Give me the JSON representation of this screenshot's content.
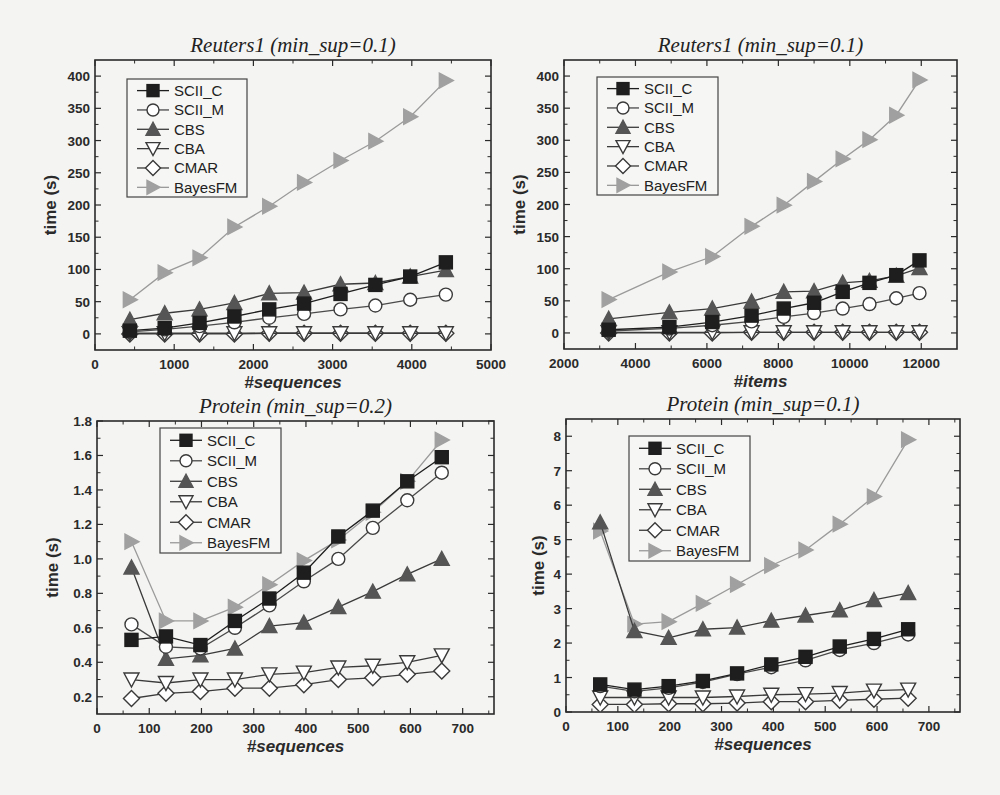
{
  "background_text": "",
  "chart_data": [
    {
      "type": "line",
      "title": "Reuters1 (min_sup=0.1)",
      "xlabel": "#sequences",
      "ylabel": "time (s)",
      "xlim": [
        0,
        5000
      ],
      "ylim": [
        -25,
        425
      ],
      "xticks": [
        0,
        1000,
        2000,
        3000,
        4000,
        5000
      ],
      "yticks": [
        0,
        50,
        100,
        150,
        200,
        250,
        300,
        350,
        400
      ],
      "ytick_labels": [
        "0",
        "50",
        "100",
        "150",
        "200",
        "250",
        "300",
        "350",
        "400"
      ],
      "frame": {
        "x0": 95,
        "y0": 60,
        "x1": 491,
        "y1": 350
      },
      "legend": {
        "x": 127,
        "y": 79,
        "w": 120,
        "h": 118
      },
      "x": [
        440,
        880,
        1320,
        1760,
        2200,
        2640,
        3100,
        3540,
        3980,
        4430
      ],
      "series": [
        {
          "name": "SCII_C",
          "values": [
            5,
            9,
            17,
            27,
            38,
            47,
            62,
            76,
            89,
            111
          ]
        },
        {
          "name": "SCII_M",
          "values": [
            3,
            7,
            12,
            18,
            25,
            31,
            38,
            44,
            53,
            61
          ]
        },
        {
          "name": "CBS",
          "values": [
            22,
            32,
            38,
            48,
            63,
            64,
            77,
            79,
            89,
            99
          ]
        },
        {
          "name": "CBA",
          "values": [
            1,
            1,
            1,
            1,
            1,
            1,
            1,
            1,
            1,
            1
          ]
        },
        {
          "name": "CMAR",
          "values": [
            0,
            0,
            0,
            0,
            1,
            1,
            1,
            1,
            1,
            1
          ]
        },
        {
          "name": "BayesFM",
          "values": [
            53,
            95,
            118,
            166,
            198,
            235,
            269,
            299,
            337,
            393
          ]
        }
      ]
    },
    {
      "type": "line",
      "title": "Reuters1  (min_sup=0.1)",
      "xlabel": "#items",
      "ylabel": "time (s)",
      "xlim": [
        2000,
        13000
      ],
      "ylim": [
        -25,
        425
      ],
      "xticks": [
        2000,
        4000,
        6000,
        8000,
        10000,
        12000
      ],
      "yticks": [
        0,
        50,
        100,
        150,
        200,
        250,
        300,
        350,
        400
      ],
      "ytick_labels": [
        "0",
        "50",
        "100",
        "150",
        "200",
        "250",
        "300",
        "350",
        "400"
      ],
      "frame": {
        "x0": 564,
        "y0": 60,
        "x1": 957,
        "y1": 349
      },
      "legend": {
        "x": 597,
        "y": 77,
        "w": 121,
        "h": 118
      },
      "x": [
        3250,
        4950,
        6150,
        7250,
        8150,
        9000,
        9800,
        10550,
        11300,
        11950
      ],
      "series": [
        {
          "name": "SCII_C",
          "values": [
            5,
            9,
            17,
            27,
            38,
            47,
            64,
            78,
            90,
            113
          ]
        },
        {
          "name": "SCII_M",
          "values": [
            3,
            7,
            12,
            18,
            25,
            31,
            38,
            45,
            54,
            62
          ]
        },
        {
          "name": "CBS",
          "values": [
            22,
            32,
            38,
            49,
            64,
            65,
            78,
            81,
            89,
            101
          ]
        },
        {
          "name": "CBA",
          "values": [
            1,
            1,
            1,
            1,
            1,
            1,
            1,
            1,
            1,
            1
          ]
        },
        {
          "name": "CMAR",
          "values": [
            0,
            0,
            0,
            1,
            1,
            1,
            1,
            1,
            1,
            1
          ]
        },
        {
          "name": "BayesFM",
          "values": [
            52,
            95,
            119,
            166,
            199,
            236,
            271,
            301,
            339,
            394
          ]
        }
      ]
    },
    {
      "type": "line",
      "title": "Protein (min_sup=0.2)",
      "xlabel": "#sequences",
      "ylabel": "time (s)",
      "xlim": [
        0,
        760
      ],
      "ylim": [
        0.1,
        1.8
      ],
      "xticks": [
        0,
        100,
        200,
        300,
        400,
        500,
        600,
        700
      ],
      "yticks": [
        0.2,
        0.4,
        0.6,
        0.8,
        1.0,
        1.2,
        1.4,
        1.6,
        1.8
      ],
      "ytick_labels": [
        "0.2",
        "0.4",
        "0.6",
        "0.8",
        "1.0",
        "1.2",
        "1.4",
        "1.6",
        "1.8"
      ],
      "frame": {
        "x0": 97,
        "y0": 421,
        "x1": 494,
        "y1": 714
      },
      "legend": {
        "x": 160,
        "y": 428,
        "w": 121,
        "h": 125
      },
      "x": [
        66,
        132,
        198,
        264,
        330,
        396,
        462,
        528,
        594,
        660
      ],
      "series": [
        {
          "name": "SCII_C",
          "values": [
            0.53,
            0.55,
            0.5,
            0.64,
            0.77,
            0.92,
            1.13,
            1.28,
            1.45,
            1.59
          ]
        },
        {
          "name": "SCII_M",
          "values": [
            0.62,
            0.49,
            0.48,
            0.6,
            0.73,
            0.87,
            1.0,
            1.18,
            1.34,
            1.5
          ]
        },
        {
          "name": "CBS",
          "values": [
            0.95,
            0.42,
            0.44,
            0.48,
            0.61,
            0.63,
            0.72,
            0.81,
            0.91,
            1.0
          ]
        },
        {
          "name": "CBA",
          "values": [
            0.3,
            0.28,
            0.3,
            0.3,
            0.33,
            0.34,
            0.37,
            0.38,
            0.4,
            0.44
          ]
        },
        {
          "name": "CMAR",
          "values": [
            0.19,
            0.22,
            0.23,
            0.25,
            0.25,
            0.27,
            0.3,
            0.31,
            0.33,
            0.35
          ]
        },
        {
          "name": "BayesFM",
          "values": [
            1.1,
            0.64,
            0.64,
            0.72,
            0.85,
            0.99,
            1.11,
            1.27,
            1.45,
            1.69
          ]
        }
      ]
    },
    {
      "type": "line",
      "title": "Protein (min_sup=0.1)",
      "xlabel": "#sequences",
      "ylabel": "time (s)",
      "xlim": [
        0,
        760
      ],
      "ylim": [
        0,
        8.5
      ],
      "xticks": [
        0,
        100,
        200,
        300,
        400,
        500,
        600,
        700
      ],
      "yticks": [
        0,
        1,
        2,
        3,
        4,
        5,
        6,
        7,
        8
      ],
      "ytick_labels": [
        "0",
        "1",
        "2",
        "3",
        "4",
        "5",
        "6",
        "7",
        "8"
      ],
      "frame": {
        "x0": 566,
        "y0": 419,
        "x1": 960,
        "y1": 712
      },
      "legend": {
        "x": 629,
        "y": 436,
        "w": 121,
        "h": 125
      },
      "x": [
        66,
        132,
        198,
        264,
        330,
        396,
        462,
        528,
        594,
        660
      ],
      "series": [
        {
          "name": "SCII_C",
          "values": [
            0.8,
            0.65,
            0.75,
            0.9,
            1.12,
            1.38,
            1.6,
            1.9,
            2.12,
            2.4
          ]
        },
        {
          "name": "SCII_M",
          "values": [
            0.75,
            0.6,
            0.7,
            0.87,
            1.1,
            1.3,
            1.5,
            1.8,
            2.0,
            2.25
          ]
        },
        {
          "name": "CBS",
          "values": [
            5.5,
            2.35,
            2.15,
            2.4,
            2.45,
            2.65,
            2.8,
            2.95,
            3.25,
            3.45
          ]
        },
        {
          "name": "CBA",
          "values": [
            0.42,
            0.42,
            0.42,
            0.42,
            0.45,
            0.5,
            0.52,
            0.55,
            0.62,
            0.65
          ]
        },
        {
          "name": "CMAR",
          "values": [
            0.22,
            0.22,
            0.24,
            0.24,
            0.26,
            0.3,
            0.3,
            0.34,
            0.37,
            0.4
          ]
        },
        {
          "name": "BayesFM",
          "values": [
            5.25,
            2.55,
            2.62,
            3.15,
            3.7,
            4.25,
            4.7,
            5.45,
            6.25,
            7.9
          ]
        }
      ]
    }
  ],
  "series_style": {
    "SCII_C": {
      "marker": "square",
      "fill": "#1e1e1e",
      "stroke": "#1e1e1e",
      "line": "#1e1e1e"
    },
    "SCII_M": {
      "marker": "circle",
      "fill": "#ffffff",
      "stroke": "#3a3a3a",
      "line": "#4a4a4a"
    },
    "CBS": {
      "marker": "triangle-up",
      "fill": "#555555",
      "stroke": "#555555",
      "line": "#3a3a3a"
    },
    "CBA": {
      "marker": "triangle-down",
      "fill": "#ffffff",
      "stroke": "#3a3a3a",
      "line": "#3a3a3a"
    },
    "CMAR": {
      "marker": "diamond",
      "fill": "#ffffff",
      "stroke": "#3a3a3a",
      "line": "#3a3a3a"
    },
    "BayesFM": {
      "marker": "triangle-right",
      "fill": "#a0a0a0",
      "stroke": "#a0a0a0",
      "line": "#9a9a9a"
    }
  },
  "figure_colors": {
    "axis": "#2a2a2a",
    "background": "#f4f4f2"
  }
}
